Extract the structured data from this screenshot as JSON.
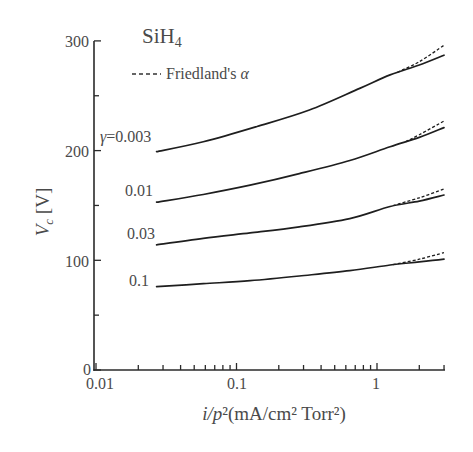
{
  "chart_data": {
    "type": "line",
    "xlabel": "i/p²(mA/cm² Torr²)",
    "ylabel": "V_c [V]",
    "xscale": "log",
    "xlim": [
      0.01,
      3
    ],
    "ylim": [
      0,
      300
    ],
    "xticks": [
      0.01,
      0.1,
      1
    ],
    "xtick_labels": [
      "0.01",
      "0.1",
      "1"
    ],
    "x_minor_ticks": [
      0.02,
      0.03,
      0.04,
      0.05,
      0.06,
      0.07,
      0.08,
      0.09,
      0.2,
      0.3,
      0.4,
      0.5,
      0.6,
      0.7,
      0.8,
      0.9,
      2,
      3
    ],
    "yticks": [
      0,
      100,
      200,
      300
    ],
    "ytick_labels": [
      "0",
      "100",
      "200",
      "300"
    ],
    "y_minor_ticks": [
      50,
      150,
      250
    ],
    "grid": false,
    "legend": [
      {
        "label": "Friedland's α",
        "style": "dashed"
      }
    ],
    "series": [
      {
        "name": "γ=0.003",
        "style": "solid",
        "points": [
          [
            0.027,
            199
          ],
          [
            0.058,
            208
          ],
          [
            0.14,
            222
          ],
          [
            0.33,
            237
          ],
          [
            0.76,
            257
          ],
          [
            1.24,
            269
          ],
          [
            2,
            278
          ],
          [
            3,
            287
          ]
        ]
      },
      {
        "name": "γ=0.01",
        "style": "solid",
        "points": [
          [
            0.027,
            153
          ],
          [
            0.058,
            160
          ],
          [
            0.125,
            168.5
          ],
          [
            0.28,
            179
          ],
          [
            0.64,
            191
          ],
          [
            1.24,
            203.5
          ],
          [
            2,
            212
          ],
          [
            3,
            221
          ]
        ]
      },
      {
        "name": "γ=0.03",
        "style": "solid",
        "points": [
          [
            0.027,
            114
          ],
          [
            0.058,
            120
          ],
          [
            0.125,
            125
          ],
          [
            0.28,
            130.5
          ],
          [
            0.64,
            138
          ],
          [
            1.24,
            149
          ],
          [
            2,
            154
          ],
          [
            3,
            159.5
          ]
        ]
      },
      {
        "name": "γ=0.1",
        "style": "solid",
        "points": [
          [
            0.027,
            76
          ],
          [
            0.058,
            78.7
          ],
          [
            0.125,
            81.4
          ],
          [
            0.28,
            85.7
          ],
          [
            0.64,
            90.5
          ],
          [
            1.24,
            95.7
          ],
          [
            2,
            98.5
          ],
          [
            3,
            101
          ]
        ]
      },
      {
        "name": "γ=0.003 (Friedland's α)",
        "style": "dashed",
        "points": [
          [
            1.4,
            271.5
          ],
          [
            2,
            281
          ],
          [
            3,
            296
          ]
        ]
      },
      {
        "name": "γ=0.01 (Friedland's α)",
        "style": "dashed",
        "points": [
          [
            1.6,
            208
          ],
          [
            2,
            214.5
          ],
          [
            3,
            227
          ]
        ]
      },
      {
        "name": "γ=0.03 (Friedland's α)",
        "style": "dashed",
        "points": [
          [
            1.3,
            150
          ],
          [
            2,
            157
          ],
          [
            3,
            165
          ]
        ]
      },
      {
        "name": "γ=0.1 (Friedland's α)",
        "style": "dashed",
        "points": [
          [
            1.3,
            96
          ],
          [
            2,
            101
          ],
          [
            3,
            107
          ]
        ]
      }
    ],
    "annotations": [
      "γ=0.003",
      "0.01",
      "0.03",
      "0.1"
    ]
  },
  "labels": {
    "title_main": "SiH",
    "title_sub": "4",
    "legend_text": "Friedland's ",
    "legend_alpha": "α",
    "gamma_symbol": "γ",
    "gamma_first": "=0.003",
    "gamma_2": "0.01",
    "gamma_3": "0.03",
    "gamma_4": "0.1",
    "ylabel_main": "V",
    "ylabel_sub": "c",
    "ylabel_unit": " [V]",
    "xlabel_italic": "i/p",
    "xlabel_rest": "²(mA/cm² Torr²)",
    "ytick_300": "300",
    "ytick_200": "200",
    "ytick_100": "100",
    "ytick_0": "0",
    "xtick_001": "0.01",
    "xtick_01": "0.1",
    "xtick_1": "1"
  }
}
